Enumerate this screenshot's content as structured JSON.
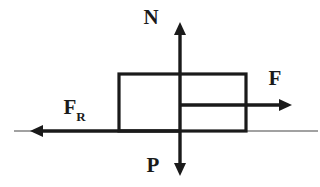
{
  "figure": {
    "background_color": "#ffffff",
    "stroke_color": "#1a1a1a",
    "ground_color": "#444444",
    "width": 320,
    "height": 187
  },
  "block": {
    "name": "block",
    "x": 119,
    "y": 74,
    "width": 127,
    "height": 57,
    "stroke_width": 3.2,
    "fill": "none"
  },
  "ground": {
    "name": "ground-line",
    "y": 131,
    "x_start": 14,
    "x_end": 318,
    "stroke_width": 1.1
  },
  "forces": [
    {
      "id": "normal",
      "label": "N",
      "subscript": "",
      "direction": "up",
      "origin_x": 180,
      "origin_y": 131,
      "tip_x": 180,
      "tip_y": 22,
      "label_x": 151,
      "label_y": 24,
      "stroke_width": 3.4
    },
    {
      "id": "applied",
      "label": "F",
      "subscript": "",
      "direction": "right",
      "origin_x": 180,
      "origin_y": 105,
      "tip_x": 292,
      "tip_y": 105,
      "label_x": 275,
      "label_y": 85,
      "stroke_width": 3.4
    },
    {
      "id": "friction",
      "label": "F",
      "subscript": "R",
      "direction": "left",
      "origin_x": 180,
      "origin_y": 131,
      "tip_x": 30,
      "tip_y": 131,
      "label_x": 70,
      "label_y": 114,
      "sub_x": 81,
      "sub_y": 121,
      "stroke_width": 3.4
    },
    {
      "id": "weight",
      "label": "P",
      "subscript": "",
      "direction": "down",
      "origin_x": 180,
      "origin_y": 131,
      "tip_x": 180,
      "tip_y": 176,
      "label_x": 153,
      "label_y": 172,
      "stroke_width": 3.4
    }
  ],
  "arrowheads": {
    "length": 13,
    "half_width": 6
  }
}
